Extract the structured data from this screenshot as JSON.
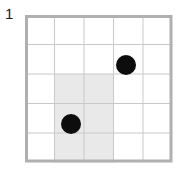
{
  "label": {
    "text": "1"
  },
  "grid": {
    "columns": 5,
    "rows": 5,
    "origin_x": 25,
    "origin_y": 15,
    "cell_size": 29.5,
    "border_color": "#b0b0b0",
    "line_color": "#c9c9c9",
    "background_color": "#ffffff",
    "outer_border_width": 3,
    "inner_line_width": 1
  },
  "shaded_region": {
    "fill_color": "#e9e9e9",
    "col_start": 2,
    "col_end": 3,
    "row_start": 3,
    "row_end": 5,
    "description": "light gray shaded block covering columns 2-3, rows 3-5"
  },
  "dots": [
    {
      "id": "dot-upper-right",
      "col": 4,
      "row": 2,
      "center_x": 126,
      "center_y": 65,
      "radius": 10,
      "color": "#0d0d0d"
    },
    {
      "id": "dot-lower-left",
      "col": 2,
      "row": 4,
      "center_x": 71,
      "center_y": 124,
      "radius": 10,
      "color": "#0d0d0d"
    }
  ]
}
